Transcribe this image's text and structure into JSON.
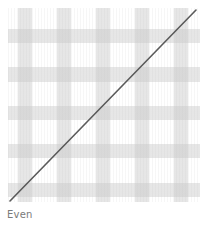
{
  "swatch": {
    "pattern": "gingham-check",
    "band_color": "#c8c8c8",
    "background": "#ffffff",
    "overlay_line": "diagonal-slash",
    "line_color": "#555555"
  },
  "label": "Even"
}
